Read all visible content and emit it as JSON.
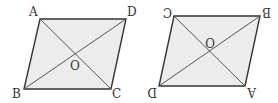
{
  "figures": [
    {
      "name": "parallelogram-ABCD",
      "vertices": {
        "A": [
          40,
          19
        ],
        "D": [
          126,
          19
        ],
        "C": [
          111,
          89
        ],
        "B": [
          24,
          89
        ]
      },
      "center": {
        "O": [
          75,
          54
        ]
      },
      "labels": {
        "A": "A",
        "B": "B",
        "C": "C",
        "D": "D",
        "O": "O"
      }
    },
    {
      "name": "parallelogram-rotated-180",
      "vertices": {
        "C": [
          174,
          16
        ],
        "B": [
          260,
          16
        ],
        "A": [
          245,
          86
        ],
        "D": [
          159,
          86
        ]
      },
      "center": {
        "O": [
          217,
          51
        ]
      },
      "labels": {
        "A": "A",
        "B": "B",
        "C": "C",
        "D": "D",
        "O": "O"
      },
      "note_rotated_labels": true
    }
  ],
  "colors": {
    "fill": "#ececec",
    "stroke": "#333333",
    "diagonal": "#555555"
  }
}
